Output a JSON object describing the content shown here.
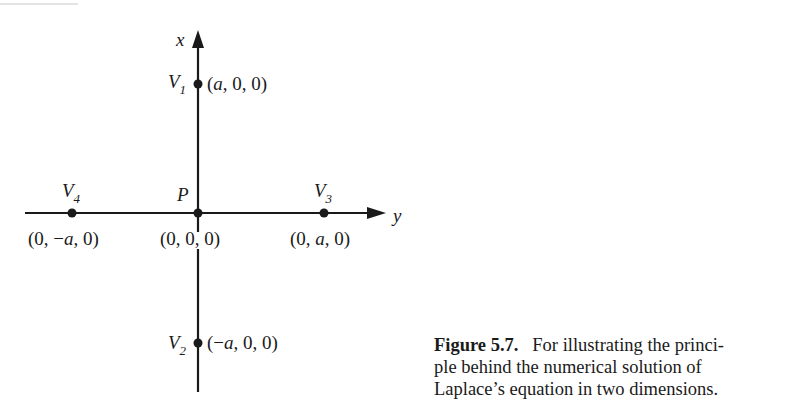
{
  "figure": {
    "axes": {
      "vertical_label": "x",
      "horizontal_label": "y"
    },
    "points": [
      {
        "id": "V1",
        "name": "V",
        "sub": "1",
        "coord": "(a, 0, 0)",
        "coord_parts": [
          "(",
          "a",
          ", 0, 0)"
        ]
      },
      {
        "id": "V2",
        "name": "V",
        "sub": "2",
        "coord": "(−a, 0, 0)",
        "coord_parts": [
          "(−",
          "a",
          ", 0, 0)"
        ]
      },
      {
        "id": "V3",
        "name": "V",
        "sub": "3",
        "coord": "(0, a, 0)",
        "coord_parts": [
          "(0, ",
          "a",
          ", 0)"
        ]
      },
      {
        "id": "V4",
        "name": "V",
        "sub": "4",
        "coord": "(0, −a, 0)",
        "coord_parts": [
          "(0, −",
          "a",
          ", 0)"
        ]
      },
      {
        "id": "P",
        "name": "P",
        "sub": "",
        "coord": "(0, 0, 0)",
        "coord_parts": [
          "(0, 0, 0)",
          "",
          ""
        ]
      }
    ]
  },
  "caption": {
    "label": "Figure 5.7.",
    "text": "For illustrating the principle behind the numerical solution of Laplace’s equation in two dimensions.",
    "lines": [
      "For illustrating the princi-",
      "ple behind the numerical solution of",
      "Laplace’s equation in two dimensions."
    ]
  }
}
